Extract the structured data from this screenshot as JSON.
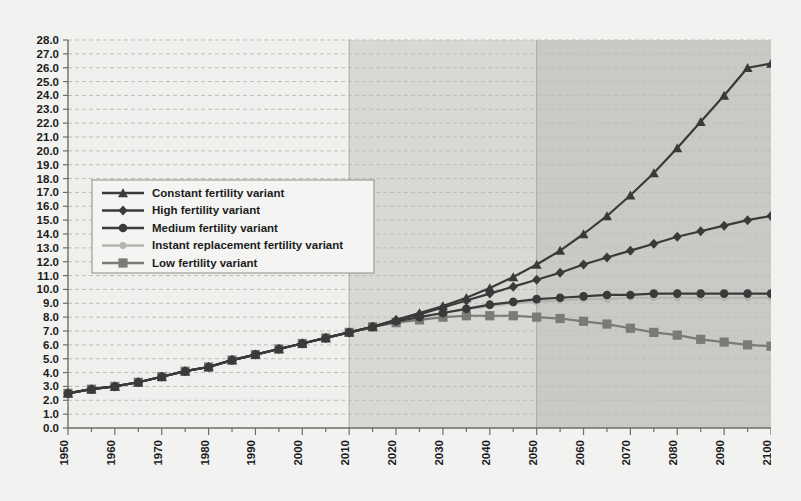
{
  "chart_data": {
    "type": "line",
    "title": "",
    "subtitle": "",
    "xlabel": "",
    "ylabel": "",
    "xlim": [
      1950,
      2100
    ],
    "ylim": [
      0.0,
      28.0
    ],
    "ytick_step": 1.0,
    "xtick_step": 10,
    "grid": "horizontal-dashed",
    "legend_position": "upper-left-inside",
    "yticks": [
      "0.0",
      "1.0",
      "2.0",
      "3.0",
      "4.0",
      "5.0",
      "6.0",
      "7.0",
      "8.0",
      "9.0",
      "10.0",
      "11.0",
      "12.0",
      "13.0",
      "14.0",
      "15.0",
      "16.0",
      "17.0",
      "18.0",
      "19.0",
      "20.0",
      "21.0",
      "22.0",
      "23.0",
      "24.0",
      "25.0",
      "26.0",
      "27.0",
      "28.0"
    ],
    "xticks": [
      "1950",
      "1960",
      "1970",
      "1980",
      "1990",
      "2000",
      "2010",
      "2020",
      "2030",
      "2040",
      "2050",
      "2060",
      "2070",
      "2080",
      "2090",
      "2100"
    ],
    "x": [
      1950,
      1955,
      1960,
      1965,
      1970,
      1975,
      1980,
      1985,
      1990,
      1995,
      2000,
      2005,
      2010,
      2015,
      2020,
      2025,
      2030,
      2035,
      2040,
      2045,
      2050,
      2055,
      2060,
      2065,
      2070,
      2075,
      2080,
      2085,
      2090,
      2095,
      2100
    ],
    "shaded_bands": [
      {
        "name": "projection-2010-2050",
        "from": 2010,
        "to": 2050,
        "color": "#d8d8d4"
      },
      {
        "name": "projection-2050-2100",
        "from": 2050,
        "to": 2100,
        "color": "#c9c9c5"
      }
    ],
    "series": [
      {
        "name": "Constant fertility variant",
        "marker": "triangle",
        "color": "#3a3a3a",
        "values": [
          2.5,
          2.8,
          3.0,
          3.3,
          3.7,
          4.1,
          4.4,
          4.9,
          5.3,
          5.7,
          6.1,
          6.5,
          6.9,
          7.3,
          7.8,
          8.3,
          8.8,
          9.4,
          10.1,
          10.9,
          11.8,
          12.8,
          14.0,
          15.3,
          16.8,
          18.4,
          20.2,
          22.1,
          24.0,
          26.0,
          26.3
        ]
      },
      {
        "name": "High fertility variant",
        "marker": "diamond",
        "color": "#3a3a3a",
        "values": [
          2.5,
          2.8,
          3.0,
          3.3,
          3.7,
          4.1,
          4.4,
          4.9,
          5.3,
          5.7,
          6.1,
          6.5,
          6.9,
          7.3,
          7.8,
          8.2,
          8.7,
          9.2,
          9.7,
          10.2,
          10.7,
          11.2,
          11.8,
          12.3,
          12.8,
          13.3,
          13.8,
          14.2,
          14.6,
          15.0,
          15.3
        ]
      },
      {
        "name": "Medium fertility variant",
        "marker": "circle",
        "color": "#3a3a3a",
        "values": [
          2.5,
          2.8,
          3.0,
          3.3,
          3.7,
          4.1,
          4.4,
          4.9,
          5.3,
          5.7,
          6.1,
          6.5,
          6.9,
          7.3,
          7.7,
          8.0,
          8.3,
          8.6,
          8.9,
          9.1,
          9.3,
          9.4,
          9.5,
          9.6,
          9.6,
          9.7,
          9.7,
          9.7,
          9.7,
          9.7,
          9.7
        ]
      },
      {
        "name": "Instant replacement fertility variant",
        "marker": "circle-small",
        "color": "#b4b4b0",
        "values": [
          2.5,
          2.8,
          3.0,
          3.3,
          3.7,
          4.1,
          4.4,
          4.9,
          5.3,
          5.7,
          6.1,
          6.5,
          6.9,
          7.3,
          7.7,
          8.0,
          8.3,
          8.6,
          8.8,
          9.0,
          9.1,
          9.2,
          9.3,
          9.3,
          9.4,
          9.4,
          9.4,
          9.4,
          9.4,
          9.4,
          9.4
        ]
      },
      {
        "name": "Low fertility variant",
        "marker": "square",
        "color": "#7a7a76",
        "values": [
          2.5,
          2.8,
          3.0,
          3.3,
          3.7,
          4.1,
          4.4,
          4.9,
          5.3,
          5.7,
          6.1,
          6.5,
          6.9,
          7.3,
          7.6,
          7.8,
          8.0,
          8.1,
          8.1,
          8.1,
          8.0,
          7.9,
          7.7,
          7.5,
          7.2,
          6.9,
          6.7,
          6.4,
          6.2,
          6.0,
          5.9
        ]
      }
    ]
  },
  "legend": {
    "entries": [
      {
        "label": "Constant fertility variant"
      },
      {
        "label": "High fertility variant"
      },
      {
        "label": "Medium fertility variant"
      },
      {
        "label": "Instant replacement fertility variant"
      },
      {
        "label": "Low fertility variant"
      }
    ]
  },
  "colors": {
    "background": "#f2f2f0",
    "plot_background": "#efefed",
    "band_light": "#d8d8d4",
    "band_dark": "#c9c9c5",
    "grid": "#bdbdb9",
    "axis": "#6d6d69",
    "text": "#1c1c1c"
  }
}
